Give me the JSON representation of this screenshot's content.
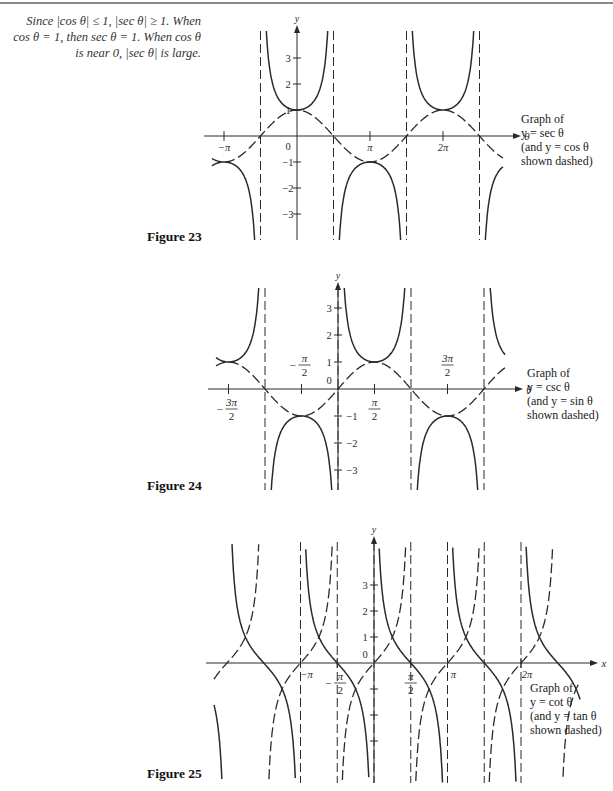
{
  "margin_note": {
    "lines": [
      "Since |cos θ| ≤ 1, |sec θ| ≥ 1.  When",
      "cos θ = 1, then sec θ = 1.  When cos θ",
      "is near 0, |sec θ| is large."
    ]
  },
  "figures": [
    {
      "label": "Figure 23",
      "caption": [
        "Graph of",
        "y = sec θ",
        "(and y = cos θ",
        "shown dashed)"
      ]
    },
    {
      "label": "Figure 24",
      "caption": [
        "Graph of",
        "y = csc θ",
        "(and y = sin θ",
        "shown dashed)"
      ]
    },
    {
      "label": "Figure 25",
      "caption": [
        "Graph of",
        "y = cot θ",
        "(and y = tan θ",
        "shown dashed)"
      ]
    }
  ],
  "chart_data": [
    {
      "type": "line",
      "title": "Figure 23",
      "xlabel": "θ",
      "ylabel": "y",
      "solid_function": "sec",
      "dashed_function": "cos",
      "x_range": [
        -3.7,
        11.3
      ],
      "y_range": [
        -4,
        4
      ],
      "origin_px": [
        297,
        136
      ],
      "px_per_pi": 73,
      "px_per_unit_y": 26,
      "top_px": 31,
      "bottom_px": 240,
      "left_px": 212,
      "right_px": 503,
      "x_ticks": [
        {
          "pi": -1,
          "label": "−π"
        },
        {
          "pi": 1,
          "label": "π"
        },
        {
          "pi": 2,
          "label": "2π"
        }
      ],
      "y_ticks": [
        3,
        2,
        1,
        -1,
        -2,
        -3
      ],
      "origin_label": "0",
      "asymptotes_pi": [
        -0.5,
        0.5,
        1.5,
        2.5
      ],
      "grid": false
    },
    {
      "type": "line",
      "title": "Figure 24",
      "xlabel": "θ",
      "ylabel": "y",
      "solid_function": "csc",
      "dashed_function": "sin",
      "origin_px": [
        338,
        389
      ],
      "px_per_pi": 73,
      "px_per_unit_y": 27,
      "top_px": 288,
      "bottom_px": 490,
      "left_px": 216,
      "right_px": 505,
      "x_ticks": [
        {
          "pi": -1.5,
          "label": "3π/2",
          "neg": true
        },
        {
          "pi": -0.5,
          "label": "π/2",
          "neg": true
        },
        {
          "pi": 0.5,
          "label": "π/2"
        },
        {
          "pi": 1.5,
          "label": "3π/2"
        }
      ],
      "y_ticks": [
        3,
        2,
        1,
        -1,
        -2,
        -3
      ],
      "origin_label": "0",
      "asymptotes_pi": [
        -1,
        0,
        1,
        2
      ],
      "grid": false
    },
    {
      "type": "line",
      "title": "Figure 25",
      "xlabel": "x",
      "ylabel": "y",
      "solid_function": "cot",
      "dashed_function": "tan",
      "origin_px": [
        374,
        663
      ],
      "px_per_pi": 73.5,
      "px_per_unit_y": 26,
      "top_px": 542,
      "bottom_px": 783,
      "left_px": 214,
      "right_px": 580,
      "x_ticks": [
        {
          "pi": -1,
          "label": "−π"
        },
        {
          "pi": -0.5,
          "label": "π/2",
          "neg": true
        },
        {
          "pi": 0.5,
          "label": "π/2"
        },
        {
          "pi": 1,
          "label": "π"
        },
        {
          "pi": 2,
          "label": "2π"
        }
      ],
      "y_ticks": [
        3,
        2,
        1,
        -1,
        -2,
        -3
      ],
      "y_tick_labels_shown": [
        3,
        2,
        1
      ],
      "origin_label": "0",
      "asymptotes_pi": [
        -1,
        -0.5,
        0,
        0.5,
        1,
        1.5,
        2
      ],
      "grid": false
    }
  ]
}
